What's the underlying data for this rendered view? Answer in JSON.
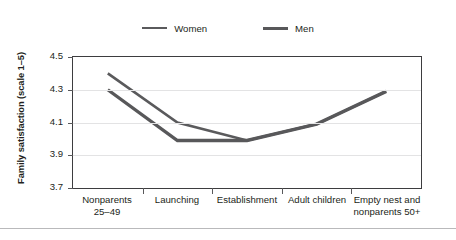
{
  "chart_data": {
    "type": "line",
    "title": "",
    "xlabel": "",
    "ylabel": "Family satisfaction (scale 1–5)",
    "ylim": [
      3.7,
      4.5
    ],
    "yticks": [
      4.5,
      4.3,
      4.1,
      3.9,
      3.7
    ],
    "ytick_labels": [
      "4.5",
      "4.3",
      "4.1",
      "3.9",
      "3.7"
    ],
    "grid": true,
    "grid_axis": "y",
    "legend_position": "top-center",
    "categories": [
      "Nonparents 25–49",
      "Launching",
      "Establishment",
      "Adult children",
      "Empty nest and nonparents 50+"
    ],
    "category_lines": [
      [
        "Nonparents",
        "25–49"
      ],
      [
        "Launching"
      ],
      [
        "Establishment"
      ],
      [
        "Adult children"
      ],
      [
        "Empty nest and",
        "nonparents 50+"
      ]
    ],
    "series": [
      {
        "name": "Women",
        "color": "#5a5a5c",
        "line_width": 2.6,
        "values": [
          4.4,
          4.1,
          3.99,
          4.09,
          4.29
        ]
      },
      {
        "name": "Men",
        "color": "#58585a",
        "line_width": 3.4,
        "values": [
          4.3,
          3.99,
          3.99,
          4.09,
          4.29
        ]
      }
    ]
  },
  "legend": {
    "items": [
      {
        "label": "Women",
        "swatch": "line-swatch-women"
      },
      {
        "label": "Men",
        "swatch": "line-swatch-men"
      }
    ]
  },
  "colors": {
    "series_gray": "#5a5a5c",
    "axis": "#3d3d3f",
    "gridline": "#e3e3e4",
    "text": "#231f20",
    "background": "#ffffff",
    "bottom_rule": "#b9b9bb"
  }
}
